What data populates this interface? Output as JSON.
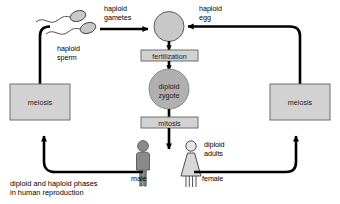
{
  "diagram": {
    "caption_line1": "diploid and haploid phases",
    "caption_line2": "in human reproduction",
    "colors": {
      "line": "#000000",
      "box_fill": "#d2d2d2",
      "box_stroke": "#6e6e6e",
      "gamete_fill": "#c8c8c8",
      "zygote_fill": "#b0b0b0",
      "male_fill": "#8a8a8a",
      "female_fill": "#d8d8d8",
      "sperm_fill": "#c0c0c0",
      "background": "#ffffff"
    },
    "nodes": {
      "meiosis_left": "meiosis",
      "meiosis_right": "meiosis",
      "fertilization": "fertilization",
      "mitosis": "mitosis",
      "zygote_line1": "diploid",
      "zygote_line2": "zygote"
    },
    "labels": {
      "haploid_sperm_line1": "haploid",
      "haploid_sperm_line2": "sperm",
      "haploid_gametes_line1": "haploid",
      "haploid_gametes_line2": "gametes",
      "haploid_egg_line1": "haploid",
      "haploid_egg_line2": "egg",
      "diploid_adults_line1": "diploid",
      "diploid_adults_line2": "adults",
      "male": "male",
      "female": "female"
    }
  }
}
